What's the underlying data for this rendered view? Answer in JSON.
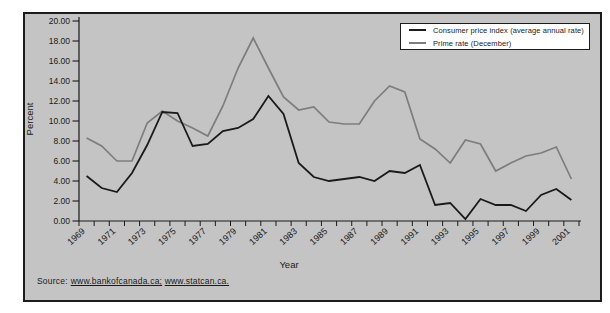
{
  "figure": {
    "background": "#c4c4c4",
    "border_color": "#1c1c1c"
  },
  "source": {
    "prefix": "Source:",
    "links": [
      "www.bankofcanada.ca;",
      "www.statcan.ca."
    ]
  },
  "chart_data": {
    "type": "line",
    "x": [
      1969,
      1970,
      1971,
      1972,
      1973,
      1974,
      1975,
      1976,
      1977,
      1978,
      1979,
      1980,
      1981,
      1982,
      1983,
      1984,
      1985,
      1986,
      1987,
      1988,
      1989,
      1990,
      1991,
      1992,
      1993,
      1994,
      1995,
      1996,
      1997,
      1998,
      1999,
      2000,
      2001
    ],
    "series": [
      {
        "name": "Consumer price index (average annual rate)",
        "color": "#1a1a1a",
        "stroke_width": 1.8,
        "values": [
          4.5,
          3.3,
          2.9,
          4.8,
          7.6,
          10.9,
          10.8,
          7.5,
          7.7,
          9.0,
          9.3,
          10.2,
          12.5,
          10.7,
          5.8,
          4.4,
          4.0,
          4.2,
          4.4,
          4.0,
          5.0,
          4.8,
          5.6,
          1.6,
          1.8,
          0.2,
          2.2,
          1.6,
          1.6,
          1.0,
          2.6,
          3.2,
          2.1
        ]
      },
      {
        "name": "Prime rate (December)",
        "color": "#7d7d7d",
        "stroke_width": 1.7,
        "values": [
          8.3,
          7.5,
          6.0,
          6.0,
          9.8,
          11.0,
          10.0,
          9.3,
          8.5,
          11.5,
          15.3,
          18.3,
          15.3,
          12.4,
          11.1,
          11.4,
          9.9,
          9.7,
          9.7,
          12.0,
          13.5,
          12.9,
          8.2,
          7.2,
          5.8,
          8.1,
          7.7,
          5.0,
          5.8,
          6.5,
          6.8,
          7.4,
          4.2
        ]
      }
    ],
    "xlabel": "Year",
    "ylabel": "Percent",
    "ylim": [
      0,
      20
    ],
    "ytick_step": 2,
    "ytick_labels": [
      "0.00",
      "2.00",
      "4.00",
      "6.00",
      "8.00",
      "10.00",
      "12.00",
      "14.00",
      "16.00",
      "18.00",
      "20.00"
    ],
    "xtick_labels": [
      "1969",
      "1971",
      "1973",
      "1975",
      "1977",
      "1979",
      "1981",
      "1983",
      "1985",
      "1987",
      "1989",
      "1991",
      "1993",
      "1995",
      "1997",
      "1999",
      "2001"
    ],
    "xtick_label_every": 2,
    "grid": false,
    "legend_position": "top-right",
    "axis_color": "#1a1a1a"
  }
}
